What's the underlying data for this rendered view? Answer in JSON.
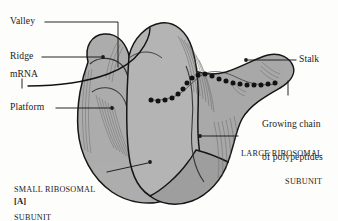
{
  "figure": {
    "panel_id": "[A]",
    "colors": {
      "background": "#fdfdfb",
      "subunit_fill": "#a9a9a9",
      "subunit_fill_light": "#b8b8b8",
      "subunit_fill_dark": "#9a9a9a",
      "outline": "#1a1a1a",
      "leader_line": "#1a1a1a",
      "polypeptide_bead": "#141414",
      "text": "#1b1b1b"
    }
  },
  "labels": {
    "valley": "Valley",
    "ridge": "Ridge",
    "mrna": "mRNA",
    "platform": "Platform",
    "stalk": "Stalk",
    "growing_chain_line1": "Growing chain",
    "growing_chain_line2": "of polypeptides",
    "large_subunit_line1": "LARGE RIBOSOMAL",
    "large_subunit_line2": "SUBUNIT",
    "small_subunit_line1": "SMALL RIBOSOMAL",
    "small_subunit_line2": "SUBUNIT",
    "panel_label": "[A]"
  },
  "parts": [
    {
      "name": "valley",
      "label": "Valley"
    },
    {
      "name": "ridge",
      "label": "Ridge"
    },
    {
      "name": "mrna",
      "label": "mRNA"
    },
    {
      "name": "platform",
      "label": "Platform"
    },
    {
      "name": "stalk",
      "label": "Stalk"
    },
    {
      "name": "growing-chain",
      "label": "Growing chain of polypeptides"
    },
    {
      "name": "large-ribosomal-subunit",
      "label": "LARGE RIBOSOMAL SUBUNIT"
    },
    {
      "name": "small-ribosomal-subunit",
      "label": "SMALL RIBOSOMAL SUBUNIT"
    }
  ]
}
